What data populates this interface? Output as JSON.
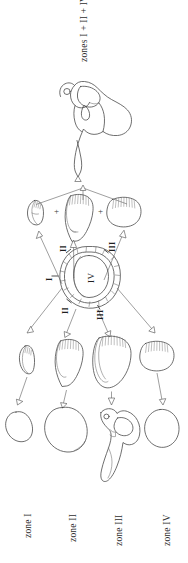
{
  "figure": {
    "title_label": "zones I + II + IV",
    "orientation_note": "rotated-90",
    "background_color": "#ffffff",
    "line_color": "#4a4a4a"
  },
  "top": {
    "composite_label": "zones I + II + IV",
    "specimen_name": "scapula-glenoid-outline"
  },
  "combination_row": {
    "operators": [
      "+",
      "+"
    ],
    "pieces": [
      {
        "name": "glenoid-piece-left",
        "hatched": true
      },
      {
        "name": "glenoid-piece-middle",
        "hatched": true
      },
      {
        "name": "glenoid-piece-right",
        "hatched": true
      }
    ]
  },
  "ring": {
    "name": "glenoid-zone-ring",
    "labels": {
      "left": "I",
      "upper_left": "II",
      "upper_right": "III",
      "lower_left": "II",
      "lower_right": "III",
      "center": "IV"
    }
  },
  "zone_pieces_row": [
    {
      "name": "zone-piece-1",
      "hatched": true
    },
    {
      "name": "zone-piece-2",
      "hatched": true
    },
    {
      "name": "zone-piece-3",
      "hatched": true
    },
    {
      "name": "zone-piece-4",
      "hatched": true
    }
  ],
  "blob_row": [
    {
      "name": "blob-zone-1"
    },
    {
      "name": "blob-zone-2"
    },
    {
      "name": "blob-zone-3-scapula"
    },
    {
      "name": "blob-zone-4"
    }
  ],
  "zone_labels": [
    {
      "text": "zone I"
    },
    {
      "text": "zone II"
    },
    {
      "text": "zone III"
    },
    {
      "text": "zone IV"
    }
  ]
}
